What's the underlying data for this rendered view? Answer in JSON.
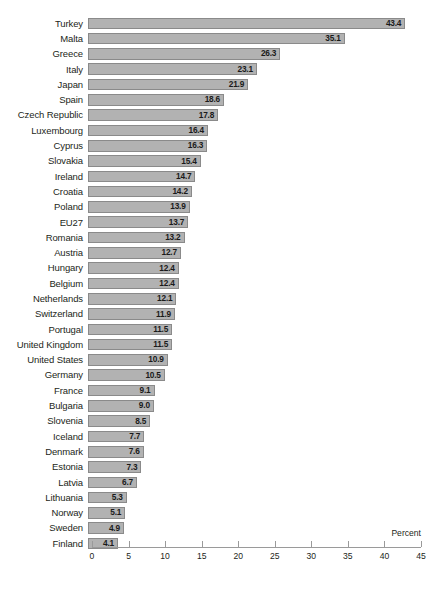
{
  "chart_data": {
    "type": "bar",
    "orientation": "horizontal",
    "title": "",
    "xlabel": "Percent",
    "ylabel": "",
    "xlim": [
      0,
      45
    ],
    "xticks": [
      0,
      5,
      10,
      15,
      20,
      25,
      30,
      35,
      40,
      45
    ],
    "grid": false,
    "legend": null,
    "bar_color": "#b2b2b2",
    "bar_border_color": "#8a8a8a",
    "background": "#ffffff",
    "value_label_position": "inside-end",
    "categories": [
      "Turkey",
      "Malta",
      "Greece",
      "Italy",
      "Japan",
      "Spain",
      "Czech Republic",
      "Luxembourg",
      "Cyprus",
      "Slovakia",
      "Ireland",
      "Croatia",
      "Poland",
      "EU27",
      "Romania",
      "Austria",
      "Hungary",
      "Belgium",
      "Netherlands",
      "Switzerland",
      "Portugal",
      "United Kingdom",
      "United States",
      "Germany",
      "France",
      "Bulgaria",
      "Slovenia",
      "Iceland",
      "Denmark",
      "Estonia",
      "Latvia",
      "Lithuania",
      "Norway",
      "Sweden",
      "Finland"
    ],
    "values": [
      43.4,
      35.1,
      26.3,
      23.1,
      21.9,
      18.6,
      17.8,
      16.4,
      16.3,
      15.4,
      14.7,
      14.2,
      13.9,
      13.7,
      13.2,
      12.7,
      12.4,
      12.4,
      12.1,
      11.9,
      11.5,
      11.5,
      10.9,
      10.5,
      9.1,
      9.0,
      8.5,
      7.7,
      7.6,
      7.3,
      6.7,
      5.3,
      5.1,
      4.9,
      4.1
    ],
    "value_labels": [
      "43.4",
      "35.1",
      "26.3",
      "23.1",
      "21.9",
      "18.6",
      "17.8",
      "16.4",
      "16.3",
      "15.4",
      "14.7",
      "14.2",
      "13.9",
      "13.7",
      "13.2",
      "12.7",
      "12.4",
      "12.4",
      "12.1",
      "11.9",
      "11.5",
      "11.5",
      "10.9",
      "10.5",
      "9.1",
      "9.0",
      "8.5",
      "7.7",
      "7.6",
      "7.3",
      "6.7",
      "5.3",
      "5.1",
      "4.9",
      "4.1"
    ],
    "xtick_labels": [
      "0",
      "5",
      "10",
      "15",
      "20",
      "25",
      "30",
      "35",
      "40",
      "45"
    ]
  }
}
